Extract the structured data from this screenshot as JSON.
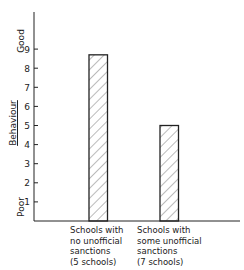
{
  "chart_data": {
    "type": "bar",
    "title": "",
    "xlabel": "",
    "ylabel": "Behaviour",
    "y_top_label": "Good",
    "y_bottom_label": "Poor",
    "ylim": [
      0,
      10.5
    ],
    "yticks": [
      1,
      2,
      3,
      4,
      5,
      6,
      7,
      8,
      9
    ],
    "grid": false,
    "legend": null,
    "bar_fill": "diagonal hatch",
    "categories": [
      "Schools with no unofficial sanctions (5 schools)",
      "Schools with some unofficial sanctions (7 schools)"
    ],
    "category_lines": [
      [
        "Schools with",
        "no unofficial",
        "sanctions",
        "(5 schools)"
      ],
      [
        "Schools with",
        "some unofficial",
        "sanctions",
        "(7 schools)"
      ]
    ],
    "values": [
      8.7,
      5.0
    ]
  },
  "labels": {
    "ylabel": "Behaviour",
    "good": "Good",
    "poor": "Poor",
    "cat1": "Schools with\nno unofficial\nsanctions\n(5 schools)",
    "cat2": "Schools with\nsome unofficial\nsanctions\n(7 schools)"
  }
}
